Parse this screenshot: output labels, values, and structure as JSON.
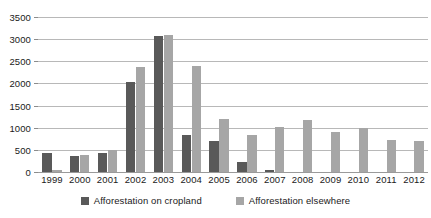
{
  "chart_data": {
    "type": "bar",
    "title": "",
    "subtitle": "",
    "xlabel": "",
    "ylabel": "",
    "categories": [
      "1999",
      "2000",
      "2001",
      "2002",
      "2003",
      "2004",
      "2005",
      "2006",
      "2007",
      "2008",
      "2009",
      "2010",
      "2011",
      "2012"
    ],
    "series": [
      {
        "name": "Afforestation on cropland",
        "color": "#595959",
        "values": [
          420,
          360,
          420,
          2030,
          3080,
          840,
          690,
          230,
          50,
          0,
          0,
          0,
          0,
          0
        ]
      },
      {
        "name": "Afforestation elsewhere",
        "color": "#a6a6a6",
        "values": [
          40,
          390,
          500,
          2380,
          3100,
          2390,
          1200,
          830,
          1010,
          1170,
          900,
          1000,
          730,
          690
        ]
      }
    ],
    "ylim": [
      0,
      3500
    ],
    "y_ticks": [
      0,
      500,
      1000,
      1500,
      2000,
      2500,
      3000,
      3500
    ],
    "y_tick_labels": [
      "0",
      "500",
      "1000",
      "1500",
      "2000",
      "2500",
      "3000",
      "3500"
    ],
    "grid": true,
    "grid_color": "#b8b8b8",
    "legend_position": "bottom",
    "background": "#ffffff"
  },
  "legend": {
    "items": [
      {
        "label": "Afforestation on cropland",
        "color": "#595959"
      },
      {
        "label": "Afforestation elsewhere",
        "color": "#a6a6a6"
      }
    ]
  }
}
